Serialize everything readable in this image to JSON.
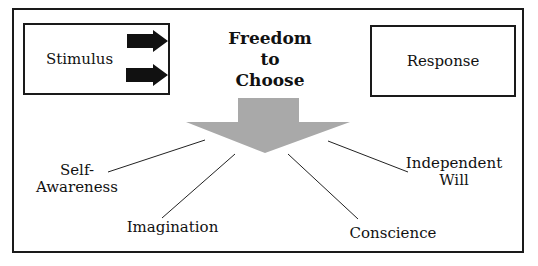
{
  "diagram": {
    "stimulus_label": "Stimulus",
    "response_label": "Response",
    "title_lines": [
      "Freedom",
      "to",
      "Choose"
    ],
    "endowments": {
      "self_awareness": [
        "Self-",
        "Awareness"
      ],
      "imagination": "Imagination",
      "conscience": "Conscience",
      "independent_will": [
        "Independent",
        "Will"
      ]
    },
    "colors": {
      "border": "#1a1a1a",
      "arrow_fill": "#a9a9a9",
      "small_arrows": "#111111"
    }
  }
}
